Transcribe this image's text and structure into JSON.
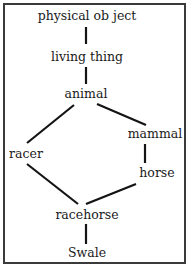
{
  "diagram": {
    "type": "inheritance-hierarchy",
    "nodes": [
      {
        "id": "physical-object",
        "label": "physical ob ject"
      },
      {
        "id": "living-thing",
        "label": "living thing"
      },
      {
        "id": "animal",
        "label": "animal"
      },
      {
        "id": "racer",
        "label": "racer"
      },
      {
        "id": "mammal",
        "label": "mammal"
      },
      {
        "id": "horse",
        "label": "horse"
      },
      {
        "id": "racehorse",
        "label": "racehorse"
      },
      {
        "id": "swale",
        "label": "Swale"
      }
    ],
    "edges": [
      {
        "from": "physical-object",
        "to": "living-thing"
      },
      {
        "from": "living-thing",
        "to": "animal"
      },
      {
        "from": "animal",
        "to": "racer"
      },
      {
        "from": "animal",
        "to": "mammal"
      },
      {
        "from": "mammal",
        "to": "horse"
      },
      {
        "from": "racer",
        "to": "racehorse"
      },
      {
        "from": "horse",
        "to": "racehorse"
      },
      {
        "from": "racehorse",
        "to": "swale"
      }
    ]
  }
}
